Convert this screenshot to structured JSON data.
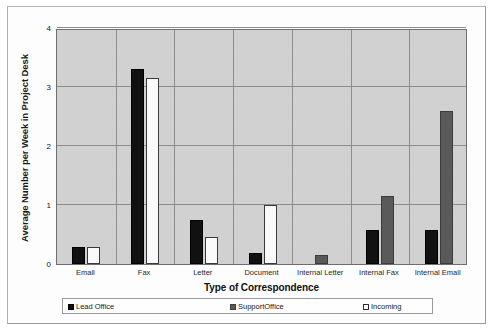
{
  "chart_data": {
    "type": "bar",
    "title": "",
    "xlabel": "Type of Correspondence",
    "ylabel": "Average Number per Week in Project Desk",
    "ylim": [
      0,
      4
    ],
    "yticks": [
      0,
      1,
      2,
      3,
      4
    ],
    "ytick_labels": [
      "0",
      "1",
      "2",
      "3",
      "4"
    ],
    "grid": true,
    "legend_position": "bottom",
    "categories": [
      "Email",
      "Fax",
      "Letter",
      "Document",
      "Internal Letter",
      "Internal Fax",
      "Internal Email"
    ],
    "series": [
      {
        "name": "Lead Office",
        "color": "#111111",
        "values": [
          0.28,
          3.3,
          0.75,
          0.18,
          0,
          0.58,
          0.58
        ]
      },
      {
        "name": "SupportOffice",
        "color": "#5a5a5a",
        "values": [
          0,
          0,
          0,
          0,
          0.15,
          1.15,
          2.6
        ]
      },
      {
        "name": "Incoming",
        "color": "#ffffff",
        "values": [
          0.28,
          3.15,
          0.45,
          1.0,
          0,
          0,
          0
        ]
      }
    ]
  },
  "legend": {
    "items": [
      {
        "label": "Lead Office",
        "swatch": "lead"
      },
      {
        "label": "SupportOffice",
        "swatch": "support"
      },
      {
        "label": "Incoming",
        "swatch": "incoming"
      }
    ]
  },
  "axes": {
    "y_title": "Average Number per Week in Project Desk",
    "x_title": "Type of Correspondence"
  }
}
